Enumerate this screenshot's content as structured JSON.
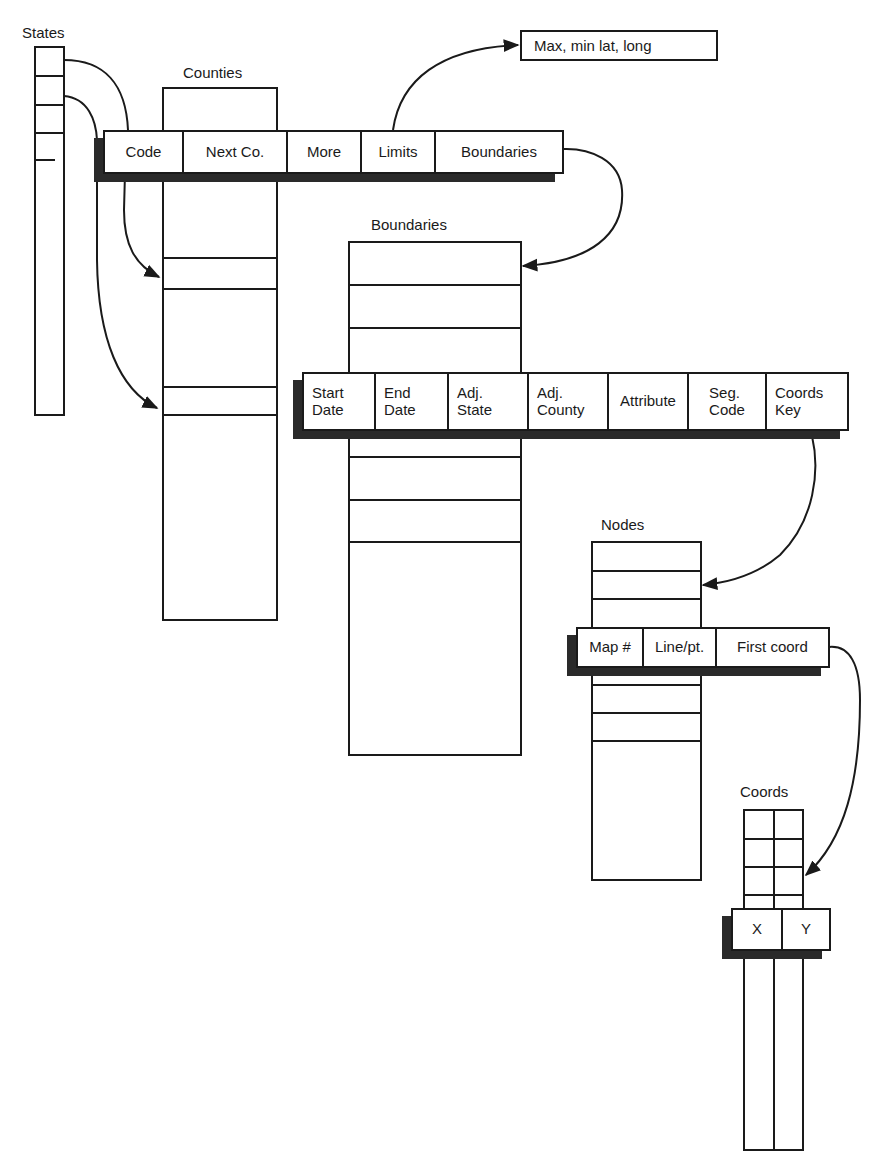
{
  "diagram": {
    "tables": {
      "states": {
        "title": "States"
      },
      "counties": {
        "title": "Counties",
        "record_fields": [
          "Code",
          "Next Co.",
          "More",
          "Limits",
          "Boundaries"
        ]
      },
      "boundaries": {
        "title": "Boundaries",
        "record_fields": [
          "Start\nDate",
          "End\nDate",
          "Adj.\nState",
          "Adj.\nCounty",
          "Attribute",
          "Seg.\nCode",
          "Coords\nKey"
        ]
      },
      "nodes": {
        "title": "Nodes",
        "record_fields": [
          "Map #",
          "Line/pt.",
          "First coord"
        ]
      },
      "coords": {
        "title": "Coords",
        "record_fields": [
          "X",
          "Y"
        ]
      }
    },
    "notes": {
      "limits_target": "Max, min lat, long"
    },
    "links": [
      {
        "from": "States",
        "to": "Counties.Code"
      },
      {
        "from": "States",
        "to": "Counties (row)"
      },
      {
        "from": "Counties.Code",
        "to": "Counties (row)"
      },
      {
        "from": "Counties.Limits",
        "to": "Max, min lat, long"
      },
      {
        "from": "Counties.Boundaries",
        "to": "Boundaries"
      },
      {
        "from": "Boundaries.Coords Key",
        "to": "Nodes"
      },
      {
        "from": "Nodes.First coord",
        "to": "Coords"
      }
    ],
    "colors": {
      "line": "#1a1a1a",
      "shadow": "#2a2a2a",
      "background": "#ffffff"
    }
  }
}
